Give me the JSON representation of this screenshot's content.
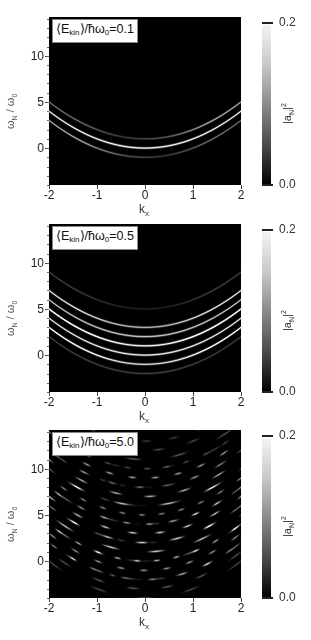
{
  "chart_data": [
    {
      "type": "heatmap",
      "title": "⟨E_kin⟩/ħω₀=0.1",
      "annotation": {
        "prefix": "⟨E",
        "sub": "kin",
        "suffix": "⟩/ħω",
        "sub2": "0",
        "value": "=0.1"
      },
      "xlabel": "k_x",
      "ylabel": "ω_N / ω_0",
      "xlim": [
        -2,
        2
      ],
      "ylim": [
        -4,
        14.2
      ],
      "xticks": [
        "-2",
        "-1",
        "0",
        "1",
        "2"
      ],
      "yticks": [
        "0",
        "5",
        "10"
      ],
      "colorbar": {
        "label": "|a_N|^2",
        "min": "0.0",
        "max": "0.2"
      },
      "model": "omega = k^2 + n + shift*k",
      "bands": [
        {
          "n": -1,
          "shift": 0.5,
          "amp": 0.45
        },
        {
          "n": 0,
          "shift": 0.0,
          "amp": 1.0
        },
        {
          "n": 1,
          "shift": -0.5,
          "amp": 0.45
        },
        {
          "n": -1,
          "shift": -0.5,
          "amp": 0.7
        },
        {
          "n": 1,
          "shift": 0.5,
          "amp": 0.7
        }
      ]
    },
    {
      "type": "heatmap",
      "title": "⟨E_kin⟩/ħω₀=0.5",
      "annotation": {
        "prefix": "⟨E",
        "sub": "kin",
        "suffix": "⟩/ħω",
        "sub2": "0",
        "value": "=0.5"
      },
      "xlabel": "k_x",
      "ylabel": "ω_N / ω_0",
      "xlim": [
        -2,
        2
      ],
      "ylim": [
        -4,
        14.2
      ],
      "xticks": [
        "-2",
        "-1",
        "0",
        "1",
        "2"
      ],
      "yticks": [
        "0",
        "5",
        "10"
      ],
      "colorbar": {
        "label": "|a_N|^2",
        "min": "0.0",
        "max": "0.2"
      },
      "model": "omega = k^2 + n + shift*k",
      "bands": [
        {
          "n": -2,
          "shift": 0.0,
          "amp": 0.25
        },
        {
          "n": -1,
          "shift": 0.0,
          "amp": 0.6
        },
        {
          "n": 0,
          "shift": 0.0,
          "amp": 0.95
        },
        {
          "n": 1,
          "shift": 0.0,
          "amp": 0.7
        },
        {
          "n": 2,
          "shift": 0.0,
          "amp": 0.8
        },
        {
          "n": 3,
          "shift": 0.0,
          "amp": 0.5
        },
        {
          "n": -1,
          "shift": 1.0,
          "amp": 0.55
        },
        {
          "n": -1,
          "shift": -1.0,
          "amp": 0.55
        },
        {
          "n": 1,
          "shift": 1.0,
          "amp": 0.6
        },
        {
          "n": 1,
          "shift": -1.0,
          "amp": 0.6
        },
        {
          "n": 3,
          "shift": 1.0,
          "amp": 0.45
        },
        {
          "n": 3,
          "shift": -1.0,
          "amp": 0.45
        },
        {
          "n": 5,
          "shift": 0.8,
          "amp": 0.25
        },
        {
          "n": 5,
          "shift": -0.8,
          "amp": 0.25
        }
      ]
    },
    {
      "type": "heatmap",
      "title": "⟨E_kin⟩/ħω₀=5.0",
      "annotation": {
        "prefix": "⟨E",
        "sub": "kin",
        "suffix": "⟩/ħω",
        "sub2": "0",
        "value": "=5.0"
      },
      "xlabel": "k_x",
      "ylabel": "ω_N / ω_0",
      "xlim": [
        -2,
        2
      ],
      "ylim": [
        -4,
        14.2
      ],
      "xticks": [
        "-2",
        "-1",
        "0",
        "1",
        "2"
      ],
      "yticks": [
        "0",
        "5",
        "10"
      ],
      "colorbar": {
        "label": "|a_N|^2",
        "min": "0.0",
        "max": "0.2"
      },
      "model": "omega = k^2 + n + shift*k (fringed)",
      "fringes": true,
      "bands": [
        {
          "n": -4,
          "shift": 0,
          "amp": 0.3
        },
        {
          "n": -3,
          "shift": 0,
          "amp": 0.35
        },
        {
          "n": -2,
          "shift": 0,
          "amp": 0.45
        },
        {
          "n": -1,
          "shift": 0,
          "amp": 0.6
        },
        {
          "n": 0,
          "shift": 0,
          "amp": 0.7
        },
        {
          "n": 1,
          "shift": 0,
          "amp": 0.8
        },
        {
          "n": 2,
          "shift": 0,
          "amp": 0.75
        },
        {
          "n": 3,
          "shift": 0,
          "amp": 0.8
        },
        {
          "n": 4,
          "shift": 0,
          "amp": 0.6
        },
        {
          "n": 5,
          "shift": 0,
          "amp": 0.55
        },
        {
          "n": 6,
          "shift": 0,
          "amp": 0.75
        },
        {
          "n": 7,
          "shift": 0,
          "amp": 0.7
        },
        {
          "n": 8,
          "shift": 0,
          "amp": 0.4
        },
        {
          "n": 9,
          "shift": 0,
          "amp": 0.65
        },
        {
          "n": 10,
          "shift": 0,
          "amp": 0.3
        },
        {
          "n": 11,
          "shift": 0,
          "amp": 0.35
        },
        {
          "n": 12,
          "shift": 0,
          "amp": 0.3
        },
        {
          "n": 13,
          "shift": 0,
          "amp": 0.25
        },
        {
          "n": -2,
          "shift": 2.5,
          "amp": 0.55
        },
        {
          "n": -2,
          "shift": -2.5,
          "amp": 0.55
        },
        {
          "n": 0,
          "shift": 2.5,
          "amp": 0.5
        },
        {
          "n": 0,
          "shift": -2.5,
          "amp": 0.5
        },
        {
          "n": 2,
          "shift": 2.5,
          "amp": 0.45
        },
        {
          "n": 2,
          "shift": -2.5,
          "amp": 0.45
        },
        {
          "n": 4,
          "shift": 2.5,
          "amp": 0.4
        },
        {
          "n": 4,
          "shift": -2.5,
          "amp": 0.4
        },
        {
          "n": 6,
          "shift": 2.5,
          "amp": 0.35
        },
        {
          "n": 6,
          "shift": -2.5,
          "amp": 0.35
        },
        {
          "n": 8,
          "shift": 2.5,
          "amp": 0.3
        },
        {
          "n": 8,
          "shift": -2.5,
          "amp": 0.3
        },
        {
          "n": 10,
          "shift": 2.5,
          "amp": 0.25
        },
        {
          "n": 10,
          "shift": -2.5,
          "amp": 0.25
        }
      ]
    }
  ]
}
